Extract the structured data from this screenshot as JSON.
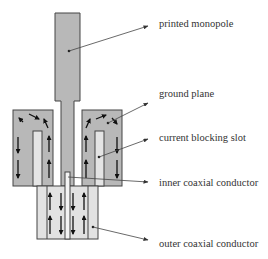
{
  "diagram": {
    "labels": {
      "printed_monopole": "printed monopole",
      "ground_plane": "ground plane",
      "current_blocking_slot": "current blocking slot",
      "inner_coaxial_conductor": "inner coaxial conductor",
      "outer_coaxial_conductor": "outer coaxial conductor"
    },
    "colors": {
      "metal_fill": "#b8b8b8",
      "slot_fill": "#e4e4e4",
      "outline": "#444444",
      "text": "#333333"
    }
  }
}
